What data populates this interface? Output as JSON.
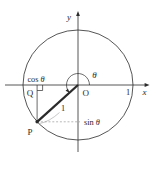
{
  "colors": {
    "ink": "#2b2b2b",
    "guide": "#9a9a9a",
    "bg": "#ffffff"
  },
  "labels": {
    "x_axis": "x",
    "y_axis": "y",
    "origin": "O",
    "point_p": "P",
    "point_q": "Q",
    "unit_tick": "1",
    "radius_length": "1",
    "angle": "θ",
    "cos": {
      "func": "cos",
      "var": "θ"
    },
    "sin": {
      "func": "sin",
      "var": "θ"
    }
  }
}
